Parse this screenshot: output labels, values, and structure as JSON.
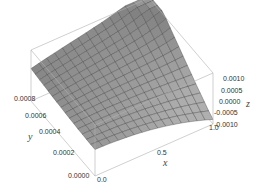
{
  "chart_data": {
    "type": "surface3d",
    "title": "",
    "xlabel": "x",
    "ylabel": "y",
    "zlabel": "z",
    "xlim": [
      0.0,
      1.0
    ],
    "ylim": [
      0.0,
      0.0009
    ],
    "zlim": [
      -0.001,
      0.001
    ],
    "x_ticks": [
      "0.0",
      "0.5",
      "1.0"
    ],
    "y_ticks": [
      "0.0000",
      "0.0002",
      "0.0004",
      "0.0006",
      "0.0008"
    ],
    "z_ticks": [
      "0.0010",
      "0.0005",
      "0.0000",
      "-0.0005",
      "-0.0010"
    ],
    "grid_resolution": [
      15,
      15
    ],
    "surface_color": "#8a8a8a",
    "mesh_color": "#3a3a3a",
    "box_color": "#b0b0b0"
  }
}
